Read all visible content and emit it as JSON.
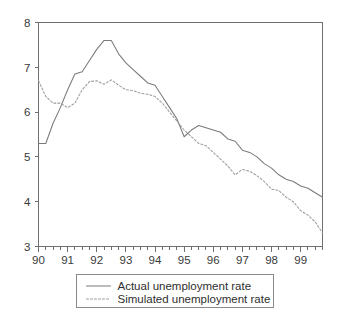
{
  "chart_data": {
    "type": "line",
    "title": "",
    "subtitle": "",
    "xlabel": "",
    "ylabel": "",
    "xlim": [
      90.0,
      99.75
    ],
    "ylim": [
      3,
      8
    ],
    "yticks": [
      "3",
      "4",
      "5",
      "6",
      "7",
      "8"
    ],
    "xticks": [
      "90",
      "91",
      "92",
      "93",
      "94",
      "95",
      "96",
      "97",
      "98",
      "99"
    ],
    "minor_ticks_per_interval": 3,
    "grid": false,
    "legend_position": "below-center",
    "colors": {
      "actual": "#7a7a7a",
      "simulated": "#9b9b9b",
      "axis": "#6f6f6f",
      "background": "#ffffff"
    },
    "series": [
      {
        "name": "Actual unemployment rate",
        "style": "solid",
        "x": [
          90.0,
          90.25,
          90.5,
          90.75,
          91.0,
          91.25,
          91.5,
          91.75,
          92.0,
          92.25,
          92.5,
          92.75,
          93.0,
          93.25,
          93.5,
          93.75,
          94.0,
          94.25,
          94.5,
          94.75,
          95.0,
          95.25,
          95.5,
          95.75,
          96.0,
          96.25,
          96.5,
          96.75,
          97.0,
          97.25,
          97.5,
          97.75,
          98.0,
          98.25,
          98.5,
          98.75,
          99.0,
          99.25,
          99.5,
          99.75
        ],
        "values": [
          5.3,
          5.3,
          5.75,
          6.1,
          6.5,
          6.85,
          6.9,
          7.15,
          7.4,
          7.6,
          7.6,
          7.3,
          7.1,
          6.95,
          6.8,
          6.65,
          6.6,
          6.35,
          6.1,
          5.85,
          5.45,
          5.6,
          5.7,
          5.65,
          5.6,
          5.55,
          5.4,
          5.35,
          5.15,
          5.1,
          5.0,
          4.85,
          4.75,
          4.6,
          4.5,
          4.45,
          4.35,
          4.3,
          4.2,
          4.1
        ]
      },
      {
        "name": "Simulated unemployment rate",
        "style": "dotted",
        "x": [
          90.0,
          90.25,
          90.5,
          90.75,
          91.0,
          91.25,
          91.5,
          91.75,
          92.0,
          92.25,
          92.5,
          92.75,
          93.0,
          93.25,
          93.5,
          93.75,
          94.0,
          94.25,
          94.5,
          94.75,
          95.0,
          95.25,
          95.5,
          95.75,
          96.0,
          96.25,
          96.5,
          96.75,
          97.0,
          97.25,
          97.5,
          97.75,
          98.0,
          98.25,
          98.5,
          98.75,
          99.0,
          99.25,
          99.5,
          99.75
        ],
        "values": [
          6.7,
          6.35,
          6.2,
          6.2,
          6.1,
          6.2,
          6.5,
          6.68,
          6.7,
          6.62,
          6.72,
          6.6,
          6.5,
          6.48,
          6.42,
          6.4,
          6.35,
          6.2,
          6.0,
          5.8,
          5.6,
          5.45,
          5.3,
          5.25,
          5.1,
          4.95,
          4.8,
          4.6,
          4.72,
          4.68,
          4.58,
          4.45,
          4.28,
          4.25,
          4.1,
          4.0,
          3.8,
          3.7,
          3.55,
          3.3
        ]
      }
    ]
  },
  "legend": {
    "entries": [
      {
        "label": "Actual unemployment rate",
        "style": "solid"
      },
      {
        "label": "Simulated unemployment rate",
        "style": "dotted"
      }
    ]
  }
}
